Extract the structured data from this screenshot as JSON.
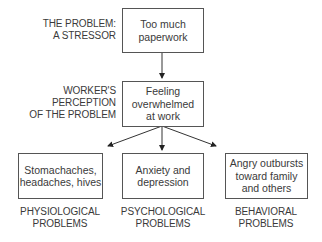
{
  "diagram": {
    "levels": [
      {
        "label": [
          "THE PROBLEM:",
          "A STRESSOR"
        ],
        "box": [
          "Too much",
          "paperwork"
        ]
      },
      {
        "label": [
          "WORKER'S",
          "PERCEPTION",
          "OF THE PROBLEM"
        ],
        "box": [
          "Feeling",
          "overwhelmed",
          "at work"
        ]
      }
    ],
    "outcomes": [
      {
        "box": [
          "Stomachaches,",
          "headaches, hives"
        ],
        "label": [
          "PHYSIOLOGICAL",
          "PROBLEMS"
        ]
      },
      {
        "box": [
          "Anxiety and",
          "depression"
        ],
        "label": [
          "PSYCHOLOGICAL",
          "PROBLEMS"
        ]
      },
      {
        "box": [
          "Angry outbursts",
          "toward family",
          "and others"
        ],
        "label": [
          "BEHAVIORAL",
          "PROBLEMS"
        ]
      }
    ],
    "colors": {
      "line": "#333333",
      "text": "#3a3a3a",
      "border": "#555555"
    }
  }
}
